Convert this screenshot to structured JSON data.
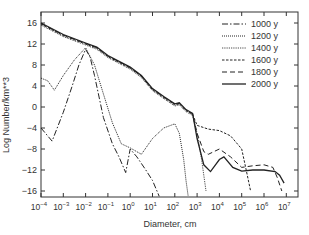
{
  "chart_data": {
    "type": "line",
    "title": "",
    "xlabel": "Diameter, cm",
    "ylabel": "Log Number/km**3",
    "xscale": "log",
    "xlim_log10": [
      -4,
      7.4
    ],
    "ylim": [
      -17.5,
      17.8
    ],
    "x_ticks": [
      "10^-4",
      "10^-3",
      "10^-2",
      "10^-1",
      "10^0",
      "10^1",
      "10^2",
      "10^3",
      "10^4",
      "10^5",
      "10^6",
      "10^7"
    ],
    "y_ticks": [
      16,
      12,
      8,
      4,
      0,
      -4,
      -8,
      -12,
      -16
    ],
    "grid": false,
    "legend_position": "upper right",
    "series": [
      {
        "name": "1000 y",
        "dash": "6,2,1.5,2",
        "log10_x": [
          -4,
          -3.5,
          -3,
          -2.6,
          -2.3,
          -2,
          -1.8,
          -1.6,
          -1.2,
          -0.8,
          -0.5,
          -0.2,
          0,
          0.3,
          0.7,
          1,
          1.3
        ],
        "y": [
          -4,
          -6.5,
          -1,
          4,
          8,
          11,
          9.5,
          6,
          -2,
          -7,
          -9.5,
          -12.5,
          -8,
          -9.5,
          -12,
          -14,
          -17
        ]
      },
      {
        "name": "1200 y",
        "dash": "1,1",
        "log10_x": [
          -4,
          -3.7,
          -3.4,
          -3,
          -2.5,
          -2,
          -1.6,
          -1.2,
          -0.8,
          -0.4,
          0,
          0.5,
          1,
          1.5,
          2,
          2.2,
          2.4,
          2.5,
          2.6
        ],
        "y": [
          5.5,
          5,
          3.2,
          6,
          9,
          11.3,
          8,
          2.5,
          -3,
          -7,
          -7.8,
          -9,
          -6,
          -4,
          -3.2,
          -5,
          -10,
          -14,
          -17
        ]
      },
      {
        "name": "1400 y",
        "dash": "0.8,1",
        "log10_x": [
          -4,
          -3,
          -2,
          -1.5,
          -1,
          0,
          0.5,
          1,
          1.5,
          2,
          2.2,
          2.5,
          2.8,
          3,
          3.2,
          3.4
        ],
        "y": [
          15.6,
          13.4,
          11.8,
          11,
          9.4,
          7.2,
          5.6,
          3.1,
          1.6,
          0.2,
          0.4,
          -0.9,
          -1.6,
          -5,
          -10,
          -16
        ]
      },
      {
        "name": "1600 y",
        "dash": "2.5,1.5",
        "log10_x": [
          -4,
          -3,
          -2,
          -1.5,
          -1,
          0,
          0.5,
          1,
          1.5,
          2,
          2.2,
          2.5,
          2.8,
          3,
          3.5,
          4,
          4.5,
          5,
          5.2,
          5.4
        ],
        "y": [
          15.8,
          13.6,
          12,
          11.2,
          9.6,
          7.4,
          5.8,
          3.3,
          1.8,
          0.4,
          0.6,
          -0.7,
          -1.4,
          -3.5,
          -4.2,
          -4.5,
          -5.5,
          -8,
          -12,
          -16
        ]
      },
      {
        "name": "1800 y",
        "dash": "5,3",
        "log10_x": [
          -4,
          -3,
          -2,
          -1.5,
          -1,
          0,
          0.5,
          1,
          1.5,
          2,
          2.2,
          2.5,
          2.8,
          3,
          3.3,
          3.5,
          4,
          4.5,
          5,
          5.5,
          6,
          6.4,
          6.6,
          6.8
        ],
        "y": [
          15.9,
          13.7,
          12.1,
          11.3,
          9.7,
          7.5,
          5.9,
          3.4,
          1.9,
          0.5,
          0.7,
          -0.6,
          -1.3,
          -5,
          -8.5,
          -9,
          -8,
          -9.5,
          -11.5,
          -11.2,
          -11,
          -11.5,
          -13.5,
          -16
        ]
      },
      {
        "name": "2000 y",
        "dash": "",
        "log10_x": [
          -4,
          -3,
          -2,
          -1.5,
          -1,
          0,
          0.5,
          1,
          1.5,
          2,
          2.2,
          2.5,
          2.8,
          3,
          3.3,
          3.6,
          4,
          4.2,
          4.6,
          5,
          5.5,
          6,
          6.5,
          6.7,
          6.9
        ],
        "y": [
          16,
          13.8,
          12.2,
          11.4,
          9.8,
          7.6,
          6,
          3.5,
          2,
          0.6,
          0.8,
          -0.5,
          -1.2,
          -6,
          -11,
          -12.3,
          -10,
          -9.5,
          -11.5,
          -12.2,
          -12,
          -12,
          -12.3,
          -13,
          -14.5
        ]
      }
    ]
  }
}
